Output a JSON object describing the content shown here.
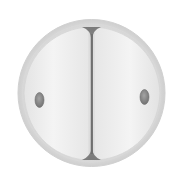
{
  "figure": {
    "title": "Two-cell embryo",
    "description": "Illustration of a zygote after first cleavage: two blastomeres separated by a cleavage furrow, enclosed in a zona pellucida, each with a nucleus.",
    "colors": {
      "background": "#ffffff",
      "zona_outer": "#d4d4d4",
      "zona_fill": "#e2e2e2",
      "blastomere_fill": "#ececec",
      "blastomere_highlight": "#f6f6f6",
      "furrow": "#7a7a7a",
      "nucleus": "#8e8e8e",
      "nucleus_edge": "#6e6e6e"
    },
    "parts": [
      {
        "name": "zona-pellucida",
        "label": "Zona pellucida"
      },
      {
        "name": "left-blastomere",
        "label": "Blastomere (left)"
      },
      {
        "name": "right-blastomere",
        "label": "Blastomere (right)"
      },
      {
        "name": "cleavage-furrow",
        "label": "Cleavage furrow"
      },
      {
        "name": "left-nucleus",
        "label": "Nucleus (left)"
      },
      {
        "name": "right-nucleus",
        "label": "Nucleus (right)"
      }
    ]
  }
}
